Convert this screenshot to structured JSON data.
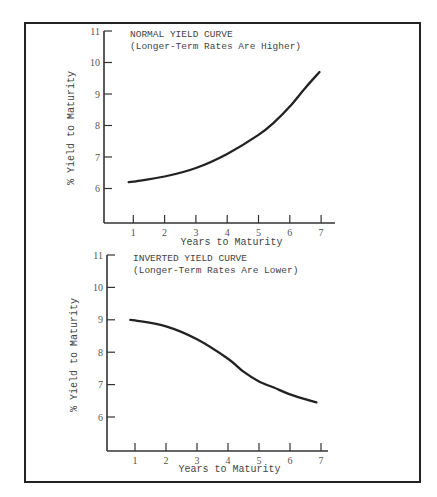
{
  "page": {
    "header_text": "Yield Curves"
  },
  "chart_data": [
    {
      "type": "line",
      "title": "NORMAL YIELD CURVE",
      "subtitle": "(Longer-Term Rates Are Higher)",
      "xlabel": "Years to Maturity",
      "ylabel": "% Yield to Maturity",
      "xticks": [
        1,
        2,
        3,
        4,
        5,
        6,
        7
      ],
      "yticks": [
        6,
        7,
        8,
        9,
        10,
        11
      ],
      "xlim": [
        0,
        7.4
      ],
      "ylim": [
        4.9,
        11
      ],
      "grid": false,
      "legend": "none",
      "series": [
        {
          "name": "Normal yield curve",
          "x": [
            0.85,
            1,
            2,
            3,
            4,
            5,
            5.5,
            6,
            6.5,
            6.95
          ],
          "y": [
            6.2,
            6.22,
            6.38,
            6.65,
            7.1,
            7.7,
            8.1,
            8.6,
            9.2,
            9.7
          ]
        }
      ],
      "annotations": []
    },
    {
      "type": "line",
      "title": "INVERTED YIELD CURVE",
      "subtitle": "(Longer-Term Rates Are Lower)",
      "xlabel": "Years to Maturity",
      "ylabel": "% Yield to Maturity",
      "xticks": [
        1,
        2,
        3,
        4,
        5,
        6,
        7
      ],
      "yticks": [
        6,
        7,
        8,
        9,
        10,
        11
      ],
      "xlim": [
        0,
        7.4
      ],
      "ylim": [
        4.9,
        11
      ],
      "grid": false,
      "legend": "none",
      "series": [
        {
          "name": "Inverted yield curve",
          "x": [
            0.85,
            1,
            2,
            3,
            4,
            4.5,
            5,
            5.5,
            6,
            6.85
          ],
          "y": [
            9.0,
            8.98,
            8.8,
            8.4,
            7.8,
            7.4,
            7.1,
            6.9,
            6.7,
            6.45
          ]
        }
      ],
      "annotations": []
    }
  ],
  "layout": {
    "panels": [
      {
        "x0": 104,
        "xAxisY": 223,
        "xEnd": 335,
        "unitX": 31.3,
        "originX": 102,
        "yTop": 31,
        "unitY": 31.5,
        "yMax": 11,
        "titleX": 130,
        "titleY": 37,
        "ylabelX": 74,
        "ylabelY": 128,
        "xlabelY": 245
      },
      {
        "x0": 107,
        "xAxisY": 451,
        "xEnd": 328,
        "unitX": 31.0,
        "originX": 104,
        "yTop": 255,
        "unitY": 32.4,
        "yMax": 11,
        "titleX": 133,
        "titleY": 261,
        "ylabelX": 77,
        "ylabelY": 355,
        "xlabelY": 472
      }
    ]
  }
}
